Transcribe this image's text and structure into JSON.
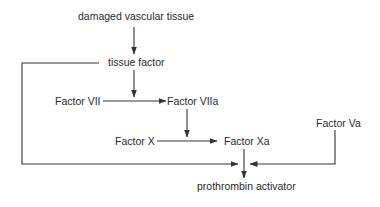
{
  "diagram": {
    "type": "flowchart",
    "topic": "extrinsic pathway of blood coagulation",
    "colors": {
      "line": "#333333",
      "text": "#2a2a2a",
      "background": "#ffffff"
    },
    "nodes": {
      "damaged": {
        "label": "damaged vascular tissue"
      },
      "tissue_factor": {
        "label": "tissue factor"
      },
      "factor_vii": {
        "label": "Factor VII"
      },
      "factor_viia": {
        "label": "Factor VIIa"
      },
      "factor_x": {
        "label": "Factor X"
      },
      "factor_xa": {
        "label": "Factor Xa"
      },
      "factor_va": {
        "label": "Factor Va"
      },
      "prothrombin_activator": {
        "label": "prothrombin activator"
      }
    },
    "edges": [
      {
        "from": "damaged vascular tissue",
        "to": "tissue factor"
      },
      {
        "from": "tissue factor",
        "to": "Factor VII → Factor VIIa conversion"
      },
      {
        "from": "Factor VII",
        "to": "Factor VIIa"
      },
      {
        "from": "Factor VIIa",
        "to": "Factor X → Factor Xa conversion"
      },
      {
        "from": "Factor X",
        "to": "Factor Xa"
      },
      {
        "from": "Factor Xa",
        "to": "prothrombin activator"
      },
      {
        "from": "tissue factor",
        "to": "prothrombin activator"
      },
      {
        "from": "Factor Va",
        "to": "prothrombin activator"
      }
    ]
  }
}
